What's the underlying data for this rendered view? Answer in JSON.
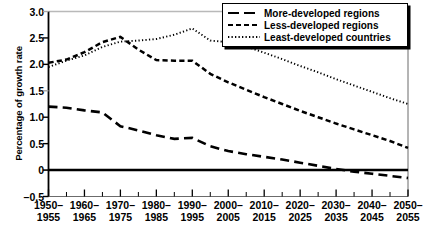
{
  "chart_data": {
    "type": "line",
    "title": "",
    "subtitle": "",
    "xlabel": "",
    "ylabel": "Percentage of growth rate",
    "ylim": [
      -0.5,
      3.0
    ],
    "yticks": [
      3.0,
      2.5,
      2.0,
      1.5,
      1.0,
      0.5,
      0,
      -0.5
    ],
    "ytick_labels": [
      "3.0",
      "2.5",
      "2.0",
      "1.5",
      "1.0",
      "0.5",
      "0",
      "-0.5"
    ],
    "grid": false,
    "legend_position": "top-right",
    "zero_line": true,
    "categories": [
      "1950-1955",
      "1955-1960",
      "1960-1965",
      "1965-1970",
      "1970-1975",
      "1975-1980",
      "1980-1985",
      "1985-1990",
      "1990-1995",
      "1995-2000",
      "2000-2005",
      "2005-2010",
      "2010-2015",
      "2015-2020",
      "2020-2025",
      "2025-2030",
      "2030-2035",
      "2035-2040",
      "2040-2045",
      "2045-2050",
      "2050-2055"
    ],
    "xtick_labels": [
      "1950-\n1955",
      "1960-\n1965",
      "1970-\n1975",
      "1980-\n1985",
      "1990-\n1995",
      "2000-\n2005",
      "2010-\n2015",
      "2020-\n2025",
      "2030-\n2035",
      "2040-\n2045",
      "2050-\n2055"
    ],
    "xtick_labels_line1": [
      "1950-",
      "1960-",
      "1970-",
      "1980-",
      "1990-",
      "2000-",
      "2010-",
      "2020-",
      "2030-",
      "2040-",
      "2050-"
    ],
    "xtick_labels_line2": [
      "1955",
      "1965",
      "1975",
      "1985",
      "1995",
      "2005",
      "2015",
      "2025",
      "2035",
      "2045",
      "2055"
    ],
    "series": [
      {
        "name": "More-developed regions",
        "style": "long-dash",
        "color": "#000000",
        "values": [
          1.2,
          1.18,
          1.13,
          1.09,
          0.83,
          0.75,
          0.66,
          0.59,
          0.61,
          0.45,
          0.36,
          0.3,
          0.25,
          0.2,
          0.14,
          0.08,
          0.02,
          -0.03,
          -0.07,
          -0.11,
          -0.15
        ]
      },
      {
        "name": "Less-developed regions",
        "style": "dash",
        "color": "#000000",
        "values": [
          2.03,
          2.09,
          2.23,
          2.42,
          2.52,
          2.28,
          2.08,
          2.07,
          2.07,
          1.82,
          1.66,
          1.52,
          1.38,
          1.25,
          1.12,
          1.0,
          0.88,
          0.77,
          0.66,
          0.55,
          0.42
        ]
      },
      {
        "name": "Least-developed countries",
        "style": "dot",
        "color": "#000000",
        "values": [
          1.95,
          2.07,
          2.17,
          2.33,
          2.43,
          2.45,
          2.48,
          2.56,
          2.68,
          2.45,
          2.42,
          2.34,
          2.22,
          2.1,
          1.97,
          1.85,
          1.72,
          1.6,
          1.48,
          1.36,
          1.25
        ]
      }
    ]
  },
  "legend": {
    "items": [
      {
        "label": "More-developed regions",
        "key": "long-dash-key"
      },
      {
        "label": "Less-developed regions",
        "key": "dash-key"
      },
      {
        "label": "Least-developed countries",
        "key": "dot-key"
      }
    ]
  }
}
